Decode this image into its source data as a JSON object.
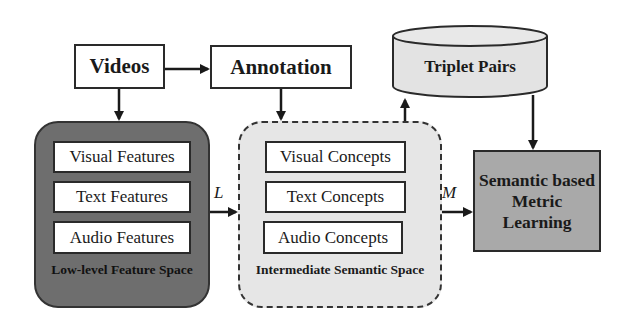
{
  "nodes": {
    "videos": {
      "label": "Videos"
    },
    "annotation": {
      "label": "Annotation"
    },
    "triplet_pairs": {
      "label": "Triplet Pairs",
      "shape": "cylinder"
    },
    "low_level_space": {
      "label": "Low-level Feature Space",
      "items": [
        "Visual Features",
        "Text Features",
        "Audio Features"
      ]
    },
    "intermediate_space": {
      "label": "Intermediate Semantic Space",
      "items": [
        "Visual Concepts",
        "Text Concepts",
        "Audio Concepts"
      ]
    },
    "metric_learning": {
      "line1": "Semantic based",
      "line2": "Metric",
      "line3": "Learning"
    }
  },
  "edges": [
    {
      "from": "videos",
      "to": "annotation",
      "label": ""
    },
    {
      "from": "videos",
      "to": "low_level_space",
      "label": ""
    },
    {
      "from": "annotation",
      "to": "intermediate_space",
      "label": ""
    },
    {
      "from": "low_level_space",
      "to": "intermediate_space",
      "label": "L"
    },
    {
      "from": "intermediate_space",
      "to": "metric_learning",
      "label": "M"
    },
    {
      "from": "intermediate_space",
      "to": "triplet_pairs",
      "label": ""
    },
    {
      "from": "triplet_pairs",
      "to": "metric_learning",
      "label": ""
    }
  ],
  "edge_labels": {
    "L": "L",
    "M": "M"
  },
  "colors": {
    "low_level_fill": "#6e6e6e",
    "intermediate_fill": "#e6e6e6",
    "metric_fill": "#a9a9a9",
    "cylinder_fill": "#e3e3e3",
    "stroke": "#2a2a2a"
  }
}
